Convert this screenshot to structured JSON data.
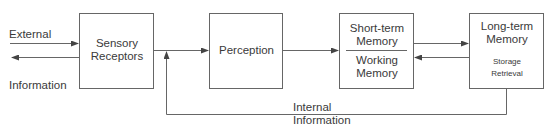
{
  "diagram": {
    "type": "information-processing-model",
    "external_labels": {
      "top": "External",
      "bottom": "Information"
    },
    "boxes": [
      {
        "id": "sensory",
        "lines": [
          "Sensory",
          "Receptors"
        ]
      },
      {
        "id": "perception",
        "lines": [
          "Perception"
        ]
      },
      {
        "id": "stm",
        "top_lines": [
          "Short-term",
          "Memory"
        ],
        "bottom_lines": [
          "Working",
          "Memory"
        ]
      },
      {
        "id": "ltm",
        "lines": [
          "Long-term",
          "Memory"
        ],
        "sub_lines": [
          "Storage",
          "Retrieval"
        ]
      }
    ],
    "feedback_label": [
      "Internal",
      "Information"
    ],
    "colors": {
      "line": "#555555",
      "text": "#3a3a3a",
      "background": "#ffffff"
    }
  }
}
